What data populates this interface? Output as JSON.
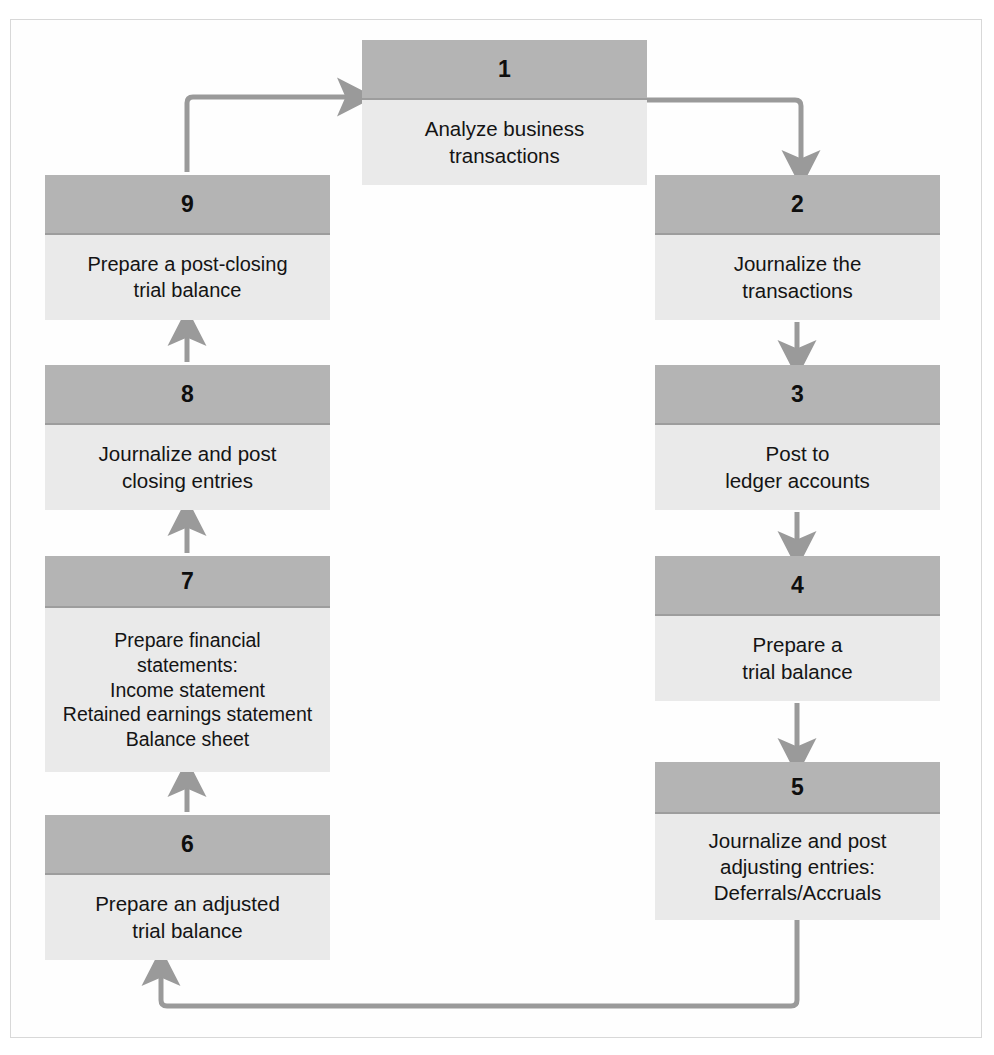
{
  "diagram": {
    "type": "cycle-flowchart",
    "colors": {
      "header_fill": "#b4b4b4",
      "body_fill": "#eaeaea",
      "connector": "#9a9a9a",
      "frame_border": "#d8d8d8",
      "text": "#141414",
      "page_background": "#ffffff"
    },
    "nodes": [
      {
        "number": "1",
        "lines": [
          "Analyze business",
          "transactions"
        ],
        "column": "top-center",
        "x": 362,
        "y": 40,
        "width": 285,
        "height": 145,
        "header_height": 60
      },
      {
        "number": "2",
        "lines": [
          "Journalize the",
          "transactions"
        ],
        "column": "right",
        "x": 655,
        "y": 175,
        "width": 285,
        "height": 145,
        "header_height": 60
      },
      {
        "number": "3",
        "lines": [
          "Post to",
          "ledger accounts"
        ],
        "column": "right",
        "x": 655,
        "y": 365,
        "width": 285,
        "height": 145,
        "header_height": 60
      },
      {
        "number": "4",
        "lines": [
          "Prepare a",
          "trial balance"
        ],
        "column": "right",
        "x": 655,
        "y": 556,
        "width": 285,
        "height": 145,
        "header_height": 60
      },
      {
        "number": "5",
        "lines": [
          "Journalize and post",
          "adjusting entries:",
          "Deferrals/Accruals"
        ],
        "column": "right",
        "x": 655,
        "y": 762,
        "width": 285,
        "height": 158,
        "header_height": 52
      },
      {
        "number": "6",
        "lines": [
          "Prepare an adjusted",
          "trial balance"
        ],
        "column": "left",
        "x": 45,
        "y": 815,
        "width": 285,
        "height": 145,
        "header_height": 60
      },
      {
        "number": "7",
        "lines": [
          "Prepare financial",
          "statements:",
          "Income statement",
          "Retained earnings statement",
          "Balance sheet"
        ],
        "column": "left",
        "x": 45,
        "y": 556,
        "width": 285,
        "height": 216,
        "header_height": 52
      },
      {
        "number": "8",
        "lines": [
          "Journalize and post",
          "closing entries"
        ],
        "column": "left",
        "x": 45,
        "y": 365,
        "width": 285,
        "height": 145,
        "header_height": 60
      },
      {
        "number": "9",
        "lines": [
          "Prepare a post-closing",
          "trial balance"
        ],
        "column": "left",
        "x": 45,
        "y": 175,
        "width": 285,
        "height": 145,
        "header_height": 60
      }
    ],
    "connectors": [
      {
        "name": "step-1-to-2",
        "from": "1",
        "to": "2",
        "shape": "right-then-down"
      },
      {
        "name": "step-2-to-3",
        "from": "2",
        "to": "3",
        "shape": "straight-down"
      },
      {
        "name": "step-3-to-4",
        "from": "3",
        "to": "4",
        "shape": "straight-down"
      },
      {
        "name": "step-4-to-5",
        "from": "4",
        "to": "5",
        "shape": "straight-down"
      },
      {
        "name": "step-5-to-6",
        "from": "5",
        "to": "6",
        "shape": "down-left-then-up"
      },
      {
        "name": "step-6-to-7",
        "from": "6",
        "to": "7",
        "shape": "straight-up"
      },
      {
        "name": "step-7-to-8",
        "from": "7",
        "to": "8",
        "shape": "straight-up"
      },
      {
        "name": "step-8-to-9",
        "from": "8",
        "to": "9",
        "shape": "straight-up"
      },
      {
        "name": "step-9-to-1",
        "from": "9",
        "to": "1",
        "shape": "up-right-then-right"
      }
    ]
  }
}
